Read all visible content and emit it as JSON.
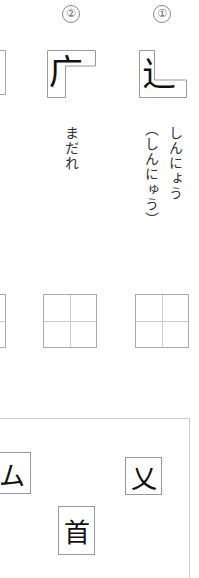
{
  "questions": [
    {
      "number_label": "②",
      "radical_char": "广",
      "reading": "まだれ",
      "reading_alt": ""
    },
    {
      "number_label": "①",
      "radical_char": "辶",
      "reading": "しんにょう",
      "reading_alt": "（しんにゅう）"
    }
  ],
  "tiles": [
    {
      "char": "ム"
    },
    {
      "char": "乂"
    },
    {
      "char": "首"
    }
  ],
  "colors": {
    "box_border": "#999999",
    "grid_line": "#cccccc",
    "frame_border": "#d0d0d0",
    "text": "#222222"
  }
}
